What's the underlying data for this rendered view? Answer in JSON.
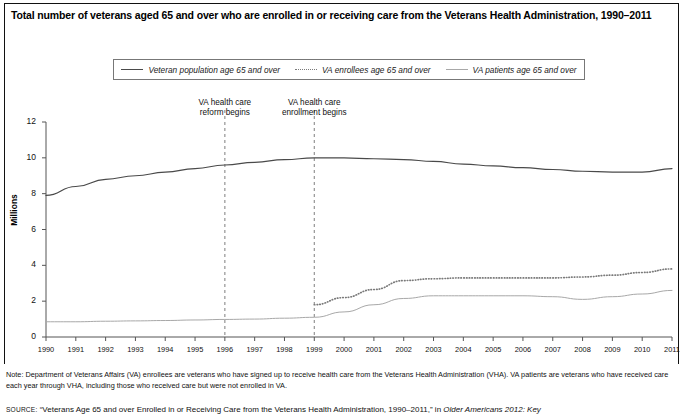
{
  "title": "Total number of veterans aged 65 and over who are enrolled in or receiving care from the Veterans Health Administration, 1990–2011",
  "legend": {
    "items": [
      {
        "label": "Veteran population age 65 and over",
        "style": "solid",
        "color": "#4a4a4a"
      },
      {
        "label": "VA enrollees age 65 and over",
        "style": "dotted",
        "color": "#7a7a7a"
      },
      {
        "label": "VA patients age 65 and over",
        "style": "light-solid",
        "color": "#a8a8a8"
      }
    ]
  },
  "annotations": [
    {
      "text": "VA health care reform begins",
      "line1": "VA health care",
      "line2": "reform begins",
      "year": 1996
    },
    {
      "text": "VA health care enrollment begins",
      "line1": "VA health care",
      "line2": "enrollment begins",
      "year": 1999
    }
  ],
  "notes": {
    "note_label": "Note:",
    "note_text": " Department of Veterans Affairs (VA) enrollees are veterans who have signed up to receive health care from the Veterans Health Administration (VHA). VA patients are veterans who have received care each year through VHA, including those who received care but were not enrolled in VA.",
    "source_label": "SOURCE:",
    "source_text_1": " “Veterans Age 65 and over Enrolled in or Receiving Care from the Veterans Health Administration, 1990–2011,” in ",
    "source_title": "Older Americans 2012: Key"
  },
  "chart_data": {
    "type": "line",
    "title": "Total number of veterans aged 65 and over who are enrolled in or receiving care from the Veterans Health Administration, 1990–2011",
    "xlabel": "",
    "ylabel": "Millions",
    "x": [
      1990,
      1991,
      1992,
      1993,
      1994,
      1995,
      1996,
      1997,
      1998,
      1999,
      2000,
      2001,
      2002,
      2003,
      2004,
      2005,
      2006,
      2007,
      2008,
      2009,
      2010,
      2011
    ],
    "xticklabels": [
      "1990",
      "1991",
      "1992",
      "1993",
      "1994",
      "1995",
      "1996",
      "1997",
      "1998",
      "1999",
      "2000",
      "2001",
      "2002",
      "2003",
      "2004",
      "2005",
      "2006",
      "2007",
      "2008",
      "2009",
      "2010",
      "2011"
    ],
    "yticklabels": [
      "0",
      "2",
      "4",
      "6",
      "8",
      "10",
      "12"
    ],
    "ylim": [
      0,
      12
    ],
    "xlim": [
      1990,
      2011
    ],
    "ytick_interval": 2,
    "grid": false,
    "legend_position": "top",
    "series": [
      {
        "name": "Veteran population age 65 and over",
        "style": "solid",
        "color": "#4a4a4a",
        "values": [
          7.9,
          8.4,
          8.8,
          9.0,
          9.2,
          9.4,
          9.6,
          9.75,
          9.9,
          10.0,
          10.0,
          9.95,
          9.9,
          9.8,
          9.65,
          9.55,
          9.45,
          9.35,
          9.25,
          9.2,
          9.2,
          9.4
        ]
      },
      {
        "name": "VA enrollees age 65 and over",
        "style": "dotted",
        "color": "#7a7a7a",
        "values": [
          null,
          null,
          null,
          null,
          null,
          null,
          null,
          null,
          null,
          1.8,
          2.2,
          2.65,
          3.15,
          3.25,
          3.3,
          3.3,
          3.3,
          3.3,
          3.35,
          3.45,
          3.6,
          3.8
        ]
      },
      {
        "name": "VA patients age 65 and over",
        "style": "light-solid",
        "color": "#a8a8a8",
        "values": [
          0.85,
          0.85,
          0.88,
          0.9,
          0.92,
          0.95,
          0.98,
          1.0,
          1.05,
          1.1,
          1.4,
          1.8,
          2.15,
          2.3,
          2.3,
          2.3,
          2.3,
          2.25,
          2.1,
          2.25,
          2.4,
          2.6
        ]
      }
    ]
  }
}
